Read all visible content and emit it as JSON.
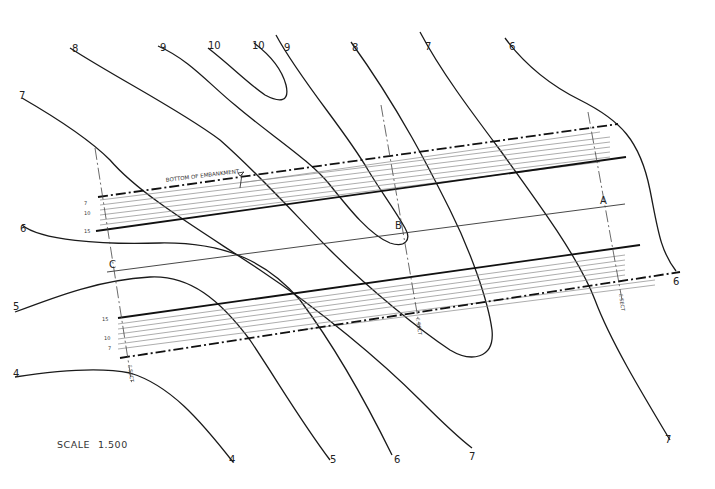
{
  "drawing": {
    "title_note": "BOTTOM OF EMBANKMENT",
    "scale_label": "SCALE",
    "scale_value": "1.500",
    "sections": {
      "A": "A",
      "B": "B",
      "C": "C",
      "sect_label": "ℰ SECT"
    },
    "upper_slope_ticks": [
      "7",
      "10",
      "15"
    ],
    "lower_slope_ticks": [
      "15",
      "10",
      "7"
    ],
    "contours_top": [
      "8",
      "9",
      "10",
      "10",
      "9",
      "8",
      "7",
      "6"
    ],
    "contours_left": [
      "7",
      "6",
      "5",
      "4"
    ],
    "contours_bottom": [
      "4",
      "5",
      "6",
      "7",
      "7"
    ],
    "contours_right": [
      "6"
    ]
  }
}
